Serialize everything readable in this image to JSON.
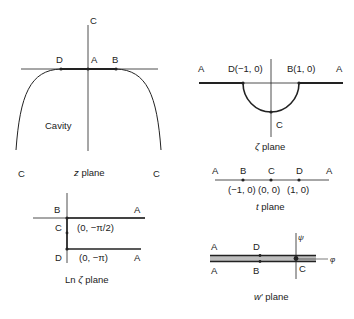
{
  "z_plane": {
    "caption_var": "z",
    "caption_rest": " plane",
    "labels": {
      "C_top": "C",
      "D": "D",
      "A": "A",
      "B": "B",
      "cavity": "Cavity",
      "C_left": "C",
      "C_right": "C"
    }
  },
  "zeta_plane": {
    "caption_var": "ζ",
    "caption_rest": " plane",
    "labels": {
      "A_left": "A",
      "D": "D(−1, 0)",
      "B": "B(1, 0)",
      "A_right": "A",
      "C": "C"
    }
  },
  "t_plane": {
    "caption_var": "t",
    "caption_rest": " plane",
    "labels": {
      "A_left": "A",
      "B": "B",
      "C": "C",
      "D": "D",
      "A_right": "A"
    },
    "coords": {
      "B": "(−1, 0)",
      "C": "(0, 0)",
      "D": "(1, 0)"
    }
  },
  "ln_zeta_plane": {
    "caption_prefix": "Ln ",
    "caption_var": "ζ",
    "caption_rest": " plane",
    "labels": {
      "B": "B",
      "A_top": "A",
      "C": "C",
      "coord_C": "(0, −π/2)",
      "D": "D",
      "coord_D": "(0, −π)",
      "A_bottom": "A"
    }
  },
  "w_prime_plane": {
    "caption_var": "w′",
    "caption_rest": " plane",
    "labels": {
      "A_top": "A",
      "D": "D",
      "A_bottom": "A",
      "B": "B",
      "C": "C",
      "psi": "ψ",
      "phi": "φ"
    }
  },
  "colors": {
    "line": "#222222",
    "shade": "#bdbdbd"
  }
}
